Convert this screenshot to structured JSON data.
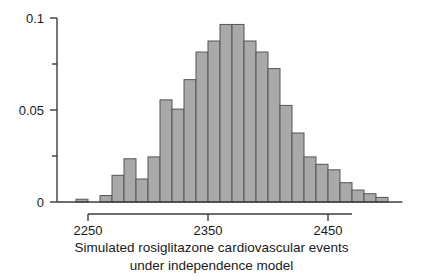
{
  "chart_data": {
    "type": "bar",
    "title": "",
    "subtitle": "",
    "xlabel": "Simulated rosiglitazone cardiovascular events under independence model",
    "ylabel": "",
    "xlim": [
      2235,
      2515
    ],
    "ylim": [
      0,
      0.1
    ],
    "bin_width": 10,
    "grid": false,
    "legend": false,
    "legend_position": "none",
    "x_tick_labels": [
      "2250",
      "2350",
      "2450"
    ],
    "x_tick_values": [
      2250,
      2350,
      2450
    ],
    "y_tick_labels": [
      "0",
      "0.05",
      "0.1"
    ],
    "y_tick_values": [
      0,
      0.05,
      0.1
    ],
    "y_minor_tick_values": [
      0.025,
      0.075
    ],
    "bin_starts": [
      2240,
      2250,
      2260,
      2270,
      2280,
      2290,
      2300,
      2310,
      2320,
      2330,
      2340,
      2350,
      2360,
      2370,
      2380,
      2390,
      2400,
      2410,
      2420,
      2430,
      2440,
      2450,
      2460,
      2470,
      2480,
      2490,
      2500
    ],
    "categories": [
      "2240-2250",
      "2250-2260",
      "2260-2270",
      "2270-2280",
      "2280-2290",
      "2290-2300",
      "2300-2310",
      "2310-2320",
      "2320-2330",
      "2330-2340",
      "2340-2350",
      "2350-2360",
      "2360-2370",
      "2370-2380",
      "2380-2390",
      "2390-2400",
      "2400-2410",
      "2410-2420",
      "2420-2430",
      "2430-2440",
      "2440-2450",
      "2450-2460",
      "2460-2470",
      "2470-2480",
      "2480-2490",
      "2490-2500",
      "2500-2510"
    ],
    "values": [
      0.0015,
      0.0,
      0.0035,
      0.0145,
      0.0235,
      0.0125,
      0.0245,
      0.0555,
      0.0505,
      0.0665,
      0.0815,
      0.0875,
      0.0965,
      0.0965,
      0.0875,
      0.0815,
      0.0725,
      0.0525,
      0.0375,
      0.0245,
      0.0205,
      0.0175,
      0.0105,
      0.0065,
      0.0045,
      0.0025,
      0.0
    ],
    "bar_color": "#a9a9a9",
    "bar_edge_color": "#555555",
    "axis_color": "#3c3c3c",
    "text_color": "#1a1a1a"
  },
  "caption": {
    "line1": "Simulated rosiglitazone cardiovascular events",
    "line2": "under independence model"
  }
}
